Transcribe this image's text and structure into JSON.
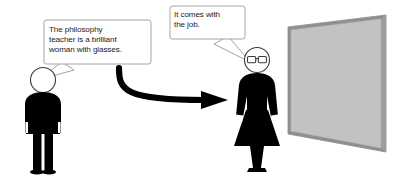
{
  "scene": {
    "title": "Cartoon: philosophy teacher stereotype",
    "width": 395,
    "height": 188,
    "background_color": "#ffffff"
  },
  "speech_bubbles": [
    {
      "id": "bubble-one",
      "speaker": "male-figure",
      "text": "The philosophy\nteacher is a brilliant\nwoman with glasses.",
      "border_color": "#9a9a9a",
      "fill_color": "#ffffff",
      "text_color": "#1a1a1a"
    },
    {
      "id": "bubble-two",
      "speaker": "female-figure",
      "text": "It comes with\nthe job.",
      "border_color": "#9a9a9a",
      "fill_color": "#ffffff",
      "text_color": "#1a1a1a"
    }
  ],
  "figures": [
    {
      "id": "male-figure",
      "label": "standing man silhouette",
      "body_color": "#000000",
      "head_fill": "#ffffff",
      "head_stroke": "#3a3a3a",
      "has_glasses": false
    },
    {
      "id": "female-figure",
      "label": "standing woman silhouette with glasses",
      "body_color": "#000000",
      "head_fill": "#ffffff",
      "head_stroke": "#3a3a3a",
      "has_glasses": true,
      "cuff_color": "#ffffff"
    }
  ],
  "arrow": {
    "id": "curved-arrow",
    "label": "curved arrow pointing from man to woman",
    "color": "#000000",
    "direction": "left-to-right"
  },
  "board": {
    "id": "presentation-board",
    "label": "blank grey board in perspective",
    "fill_color": "#c2c2c2",
    "frame_color": "#8f8f8f",
    "edge_color": "#a8a8a8"
  },
  "colors": {
    "ink": "#000000",
    "bubble_stroke": "#9a9a9a",
    "board_fill": "#c2c2c2",
    "board_frame": "#8f8f8f",
    "page_background": "#ffffff"
  }
}
